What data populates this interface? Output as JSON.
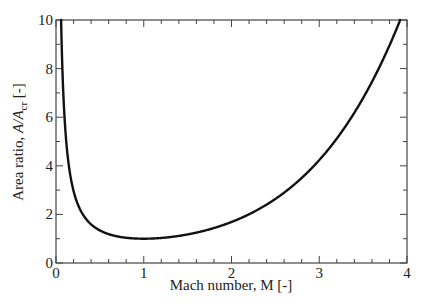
{
  "chart_data": {
    "type": "line",
    "title": "",
    "xlabel": "Mach number, M [-]",
    "ylabel": "Area ratio, A/A_cr [-]",
    "ylabel_parts": {
      "prefix": "Area ratio, ",
      "italic": "A/A",
      "sub": "cr",
      "suffix": " [-]"
    },
    "xlim": [
      0,
      4
    ],
    "ylim": [
      0,
      10
    ],
    "x_ticks": [
      "0",
      "1",
      "2",
      "3",
      "4"
    ],
    "y_ticks": [
      "0",
      "2",
      "4",
      "6",
      "8",
      "10"
    ],
    "x_minor_step": 0.2,
    "y_minor_step": 1,
    "grid": false,
    "legend": null,
    "series": [
      {
        "name": "A/A_cr (isentropic, gamma = 1.4)",
        "color": "#111111",
        "x": [
          0.06,
          0.08,
          0.1,
          0.15,
          0.2,
          0.3,
          0.4,
          0.5,
          0.6,
          0.7,
          0.8,
          0.9,
          1.0,
          1.2,
          1.4,
          1.6,
          1.8,
          2.0,
          2.2,
          2.4,
          2.6,
          2.8,
          3.0,
          3.2,
          3.4,
          3.6,
          3.8,
          3.92
        ],
        "y": [
          9.67,
          7.26,
          5.82,
          3.91,
          2.96,
          2.04,
          1.59,
          1.34,
          1.19,
          1.09,
          1.04,
          1.01,
          1.0,
          1.03,
          1.11,
          1.25,
          1.44,
          1.69,
          2.01,
          2.4,
          2.9,
          3.5,
          4.23,
          5.12,
          6.18,
          7.45,
          8.95,
          10.0
        ]
      }
    ]
  }
}
